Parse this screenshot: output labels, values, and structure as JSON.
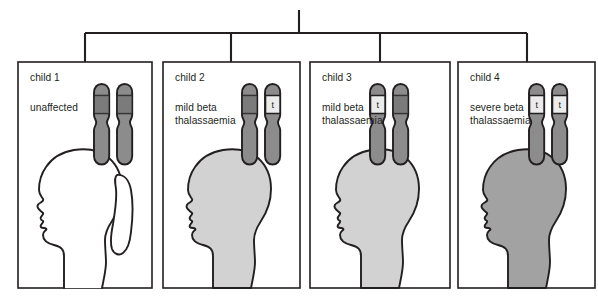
{
  "diagram": {
    "type": "inheritance-pedigree",
    "title": "",
    "connector": {
      "name": "pedigree-bracket",
      "stem_top_y": 10,
      "bar_y": 33,
      "bar_left_x": 85,
      "bar_right_x": 527,
      "stem_x": 299,
      "drop_bottom_y": 62
    },
    "colors": {
      "line": "#231f20",
      "panel_border": "#231f20",
      "panel_background": "#ffffff",
      "head_unaffected": "#ffffff",
      "head_mild": "#d2d2d2",
      "head_severe": "#a2a2a2",
      "chromosome_body": "#8c8c8c",
      "chromosome_band": "#6e6e6e",
      "chromosome_outline": "#231f20",
      "allele_box": "#ebebeb"
    },
    "legend_note": "",
    "children": [
      {
        "id": "child 1",
        "condition": "unaffected",
        "severity": "none",
        "head_fill": "#ffffff",
        "has_ponytail": true,
        "chromosomes": [
          {
            "side": "left",
            "allele": "",
            "allele_visible": false
          },
          {
            "side": "right",
            "allele": "",
            "allele_visible": false
          }
        ],
        "panel": {
          "x": 18,
          "y": 62,
          "w": 134,
          "h": 226
        }
      },
      {
        "id": "child 2",
        "condition": "mild beta\nthalassaemia",
        "severity": "mild",
        "head_fill": "#d2d2d2",
        "has_ponytail": false,
        "chromosomes": [
          {
            "side": "left",
            "allele": "",
            "allele_visible": false
          },
          {
            "side": "right",
            "allele": "t",
            "allele_visible": true
          }
        ],
        "panel": {
          "x": 163,
          "y": 62,
          "w": 137,
          "h": 226
        }
      },
      {
        "id": "child 3",
        "condition": "mild beta\nthalassaemia",
        "severity": "mild",
        "head_fill": "#d2d2d2",
        "has_ponytail": false,
        "chromosomes": [
          {
            "side": "left",
            "allele": "t",
            "allele_visible": true
          },
          {
            "side": "right",
            "allele": "",
            "allele_visible": false
          }
        ],
        "panel": {
          "x": 310,
          "y": 62,
          "w": 140,
          "h": 226
        }
      },
      {
        "id": "child 4",
        "condition": "severe beta\nthalassaemia",
        "severity": "severe",
        "head_fill": "#a2a2a2",
        "has_ponytail": false,
        "chromosomes": [
          {
            "side": "left",
            "allele": "t",
            "allele_visible": true
          },
          {
            "side": "right",
            "allele": "t",
            "allele_visible": true
          }
        ],
        "panel": {
          "x": 458,
          "y": 62,
          "w": 137,
          "h": 226
        }
      }
    ]
  }
}
